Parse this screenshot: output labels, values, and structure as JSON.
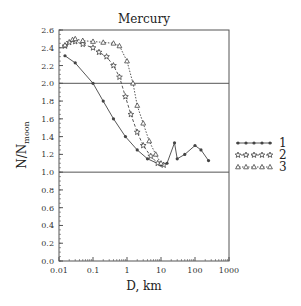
{
  "chart_data": {
    "type": "line",
    "title": "Mercury",
    "xlabel": "D, km",
    "ylabel": "N/N",
    "ylabel_subscript": "moon",
    "xscale": "log",
    "xlim": [
      0.01,
      1000
    ],
    "ylim": [
      0.0,
      2.6
    ],
    "x_ticks": [
      "0.01",
      "0.1",
      "1",
      "10",
      "100",
      "1000"
    ],
    "y_ticks": [
      "0.0",
      "0.2",
      "0.4",
      "0.6",
      "0.8",
      "1.0",
      "1.2",
      "1.4",
      "1.6",
      "1.8",
      "2.0",
      "2.2",
      "2.4",
      "2.6"
    ],
    "reference_lines": [
      1.0,
      2.0
    ],
    "legend_position": "right",
    "series": [
      {
        "name": "1",
        "marker": "dot",
        "line": "solid",
        "x": [
          0.015,
          0.03,
          0.1,
          0.2,
          0.4,
          0.9,
          2,
          4,
          10,
          15,
          25,
          30,
          50,
          100,
          150,
          250
        ],
        "values": [
          2.31,
          2.23,
          2.0,
          1.8,
          1.6,
          1.4,
          1.25,
          1.15,
          1.08,
          1.1,
          1.33,
          1.15,
          1.2,
          1.3,
          1.25,
          1.13
        ]
      },
      {
        "name": "2",
        "marker": "star",
        "line": "dashed",
        "x": [
          0.015,
          0.02,
          0.03,
          0.05,
          0.1,
          0.15,
          0.25,
          0.4,
          0.6,
          0.9,
          1.3,
          2,
          3,
          5,
          8,
          12
        ],
        "values": [
          2.42,
          2.46,
          2.47,
          2.44,
          2.4,
          2.35,
          2.3,
          2.2,
          2.07,
          1.85,
          1.65,
          1.45,
          1.3,
          1.18,
          1.1,
          1.08
        ]
      },
      {
        "name": "3",
        "marker": "triangle",
        "line": "dotted",
        "x": [
          0.015,
          0.025,
          0.03,
          0.05,
          0.1,
          0.2,
          0.4,
          0.6,
          1,
          1.5,
          2,
          3,
          4.5,
          7,
          10
        ],
        "values": [
          2.43,
          2.49,
          2.5,
          2.48,
          2.47,
          2.46,
          2.45,
          2.42,
          2.25,
          2.0,
          1.75,
          1.55,
          1.35,
          1.2,
          1.1
        ]
      }
    ]
  },
  "legend": {
    "items": [
      {
        "label": "1",
        "marker": "dot"
      },
      {
        "label": "2",
        "marker": "star"
      },
      {
        "label": "3",
        "marker": "triangle"
      }
    ]
  },
  "colors": {
    "line": "#444444",
    "frame": "#555555",
    "text": "#222222"
  }
}
